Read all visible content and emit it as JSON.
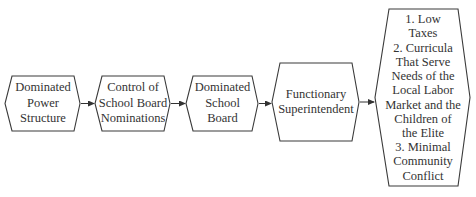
{
  "diagram": {
    "type": "flow",
    "direction": "left-to-right",
    "nodes": [
      {
        "id": "n1",
        "lines": [
          "Dominated",
          "Power",
          "Structure"
        ]
      },
      {
        "id": "n2",
        "lines": [
          "Control of",
          "School Board",
          "Nominations"
        ]
      },
      {
        "id": "n3",
        "lines": [
          "Dominated",
          "School",
          "Board"
        ]
      },
      {
        "id": "n4",
        "lines": [
          "Functionary",
          "Superintendent"
        ]
      },
      {
        "id": "n5",
        "lines": [
          "1. Low",
          "Taxes",
          "2. Curricula",
          "That Serve",
          "Needs of the",
          "Local Labor",
          "Market and the",
          "Children of",
          "the Elite",
          "3. Minimal",
          "Community",
          "Conflict"
        ]
      }
    ],
    "edges": [
      {
        "from": "n1",
        "to": "n2"
      },
      {
        "from": "n2",
        "to": "n3"
      },
      {
        "from": "n3",
        "to": "n4"
      },
      {
        "from": "n4",
        "to": "n5"
      }
    ],
    "colors": {
      "stroke": "#3a3a3a",
      "text": "#333333",
      "background": "#ffffff"
    }
  }
}
